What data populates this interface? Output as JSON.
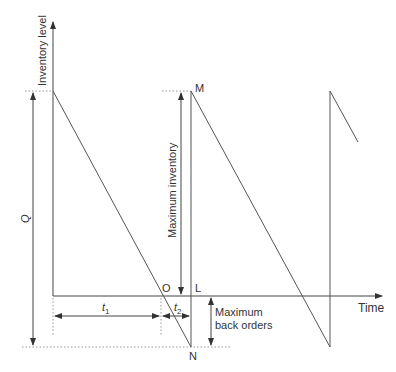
{
  "diagram": {
    "axes": {
      "y_label": "Inventory level",
      "x_label": "Time"
    },
    "points": {
      "M": "M",
      "N": "N",
      "O": "O",
      "L": "L"
    },
    "dimensions": {
      "Q": "Q",
      "max_inventory": "Maximum inventory",
      "max_back_orders_line1": "Maximum",
      "max_back_orders_line2": "back orders",
      "t1": "t",
      "t1_sub": "1",
      "t2": "t",
      "t2_sub": "2"
    },
    "colors": {
      "line": "#555555",
      "dotted": "#999999",
      "text": "#333333"
    }
  }
}
